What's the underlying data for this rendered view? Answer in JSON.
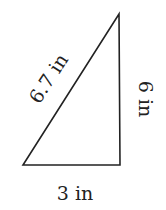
{
  "diagram": {
    "shape": "right-triangle",
    "stroke_color": "#222222",
    "sides": {
      "hypotenuse": "6.7 in",
      "vertical": "6 in",
      "base": "3 in"
    }
  }
}
